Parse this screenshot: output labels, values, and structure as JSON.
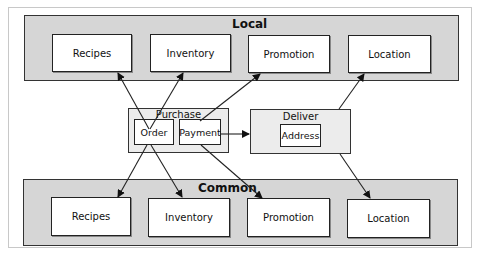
{
  "diagram": {
    "local": {
      "title": "Local",
      "boxes": [
        "Recipes",
        "Inventory",
        "Promotion",
        "Location"
      ]
    },
    "common": {
      "title": "Common",
      "boxes": [
        "Recipes",
        "Inventory",
        "Promotion",
        "Location"
      ]
    },
    "purchase": {
      "title": "Purchase",
      "order": "Order",
      "payment": "Payment"
    },
    "deliver": {
      "title": "Deliver",
      "address": "Address"
    },
    "edges": [
      {
        "from": "Purchase.Order",
        "to": "Local.Recipes"
      },
      {
        "from": "Purchase.Order",
        "to": "Local.Inventory"
      },
      {
        "from": "Purchase",
        "to": "Local.Promotion"
      },
      {
        "from": "Deliver",
        "to": "Local.Location"
      },
      {
        "from": "Purchase.Payment",
        "to": "Deliver"
      },
      {
        "from": "Purchase.Order",
        "to": "Common.Recipes"
      },
      {
        "from": "Purchase.Order",
        "to": "Common.Inventory"
      },
      {
        "from": "Purchase.Payment",
        "to": "Common.Promotion"
      },
      {
        "from": "Deliver",
        "to": "Common.Location"
      }
    ],
    "colors": {
      "panel_fill": "#d6d6d6",
      "group_fill": "#ececec",
      "box_fill": "#ffffff",
      "stroke": "#222222"
    }
  }
}
